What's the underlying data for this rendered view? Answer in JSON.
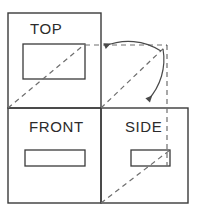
{
  "diagram": {
    "type": "engineering-drawing",
    "canvas": {
      "width": 199,
      "height": 216
    },
    "colors": {
      "background": "#ffffff",
      "solid_line": "#3a3a3a",
      "dashed_line": "#6e6e6e",
      "label_text": "#2b2b2b",
      "arrow": "#4a4a4a"
    },
    "views": [
      {
        "id": "top",
        "label": "TOP",
        "label_x": 30,
        "label_y": 34,
        "frame": {
          "x": 8,
          "y": 13,
          "width": 93,
          "height": 95
        },
        "feature_rect": {
          "x": 23,
          "y": 44,
          "width": 62,
          "height": 35
        }
      },
      {
        "id": "front",
        "label": "FRONT",
        "label_x": 29,
        "label_y": 132,
        "frame": {
          "x": 8,
          "y": 108,
          "width": 93,
          "height": 95
        },
        "feature_rect": {
          "x": 25,
          "y": 150,
          "width": 60,
          "height": 16
        }
      },
      {
        "id": "side",
        "label": "SIDE",
        "label_x": 125,
        "label_y": 132,
        "frame": {
          "x": 101,
          "y": 108,
          "width": 87,
          "height": 95
        },
        "feature_rect": {
          "x": 131,
          "y": 150,
          "width": 39,
          "height": 16
        }
      }
    ],
    "construction": {
      "miter_corner": {
        "x": 167,
        "y": 45
      },
      "miter_origin": {
        "x": 101,
        "y": 108
      },
      "miter_line_angle_degrees": 45,
      "projector_horizontal": {
        "x1": 85,
        "y1": 45,
        "x2": 167,
        "y2": 45
      },
      "projector_vertical": {
        "x1": 167,
        "y1": 45,
        "x2": 167,
        "y2": 166
      },
      "top_view_diagonal": {
        "x1": 8,
        "y1": 108,
        "x2": 85,
        "y2": 44
      },
      "side_view_diagonal": {
        "x1": 101,
        "y1": 203,
        "x2": 170,
        "y2": 150
      },
      "dash_pattern": "5,4"
    },
    "arrows": [
      {
        "id": "arrow-to-top",
        "description": "curved arrow sweeping from miter corner to the TOP view projector",
        "path": "M 161 51 A 60 60 0 0 0 105 46",
        "tip": {
          "x": 103,
          "y": 46
        },
        "direction": "left"
      },
      {
        "id": "arrow-to-side",
        "description": "curved arrow sweeping from miter corner down to the SIDE view projector",
        "path": "M 163 49 A 60 60 0 0 1 148 100",
        "tip": {
          "x": 148,
          "y": 104
        },
        "direction": "down"
      }
    ]
  }
}
